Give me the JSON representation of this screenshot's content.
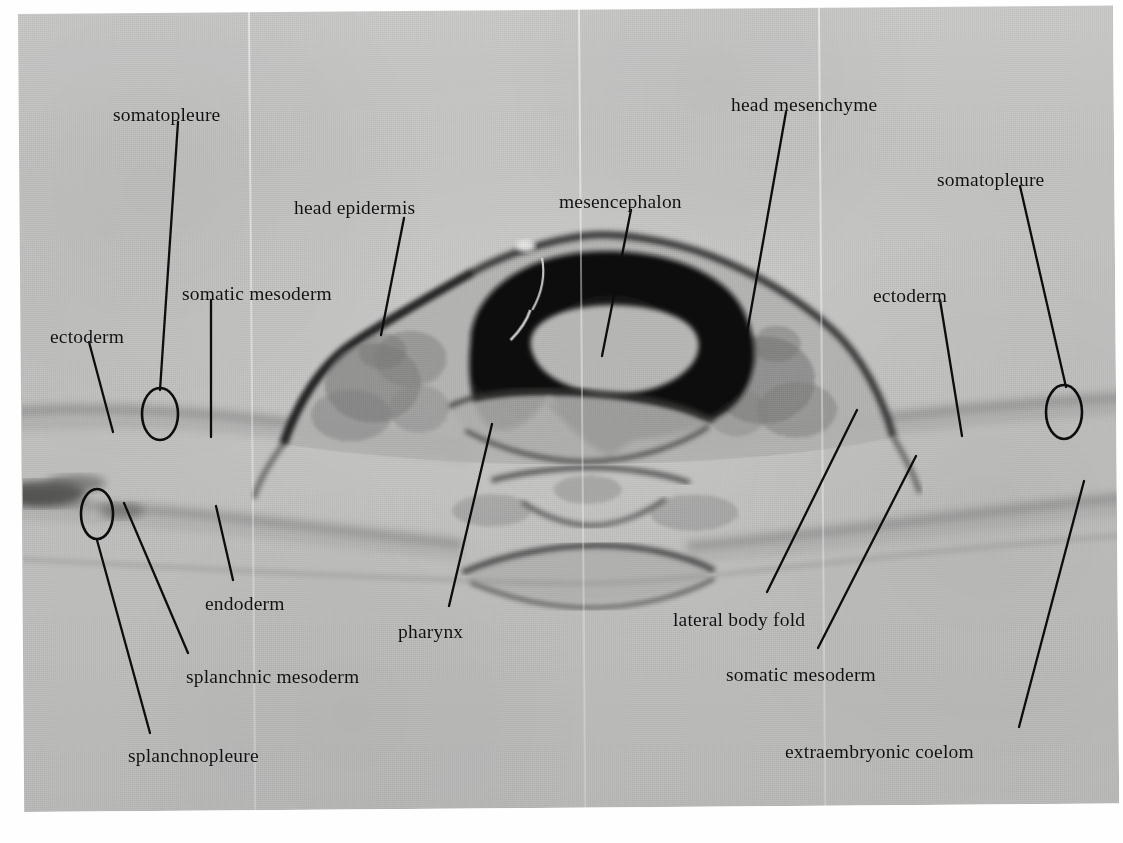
{
  "figure": {
    "kind": "light-micrograph",
    "plate_background_hex": "#c7c7c6",
    "ink_hex": "#0d0d0d",
    "page_background_hex": "#ffffff"
  },
  "labels": [
    {
      "id": "somatopleure-left",
      "text": "somatopleure",
      "x": 113,
      "y": 105
    },
    {
      "id": "head-mesenchyme",
      "text": "head mesenchyme",
      "x": 731,
      "y": 95
    },
    {
      "id": "somatopleure-right",
      "text": "somatopleure",
      "x": 937,
      "y": 170
    },
    {
      "id": "head-epidermis",
      "text": "head epidermis",
      "x": 294,
      "y": 198
    },
    {
      "id": "mesencephalon",
      "text": "mesencephalon",
      "x": 559,
      "y": 192
    },
    {
      "id": "somatic-mesoderm-left",
      "text": "somatic mesoderm",
      "x": 182,
      "y": 284
    },
    {
      "id": "ectoderm-right",
      "text": "ectoderm",
      "x": 873,
      "y": 286
    },
    {
      "id": "ectoderm-left",
      "text": "ectoderm",
      "x": 50,
      "y": 327
    },
    {
      "id": "endoderm",
      "text": "endoderm",
      "x": 205,
      "y": 594
    },
    {
      "id": "pharynx",
      "text": "pharynx",
      "x": 398,
      "y": 622
    },
    {
      "id": "lateral-body-fold",
      "text": "lateral body fold",
      "x": 673,
      "y": 610
    },
    {
      "id": "splanchnic-mesoderm",
      "text": "splanchnic mesoderm",
      "x": 186,
      "y": 667
    },
    {
      "id": "somatic-mesoderm-right",
      "text": "somatic mesoderm",
      "x": 726,
      "y": 665
    },
    {
      "id": "splanchnopleure",
      "text": "splanchnopleure",
      "x": 128,
      "y": 746
    },
    {
      "id": "extraembryonic-coelom",
      "text": "extraembryonic coelom",
      "x": 785,
      "y": 742
    }
  ],
  "leaders": [
    {
      "id": "leader-somatopleure-left",
      "points": "178,122 160,390"
    },
    {
      "id": "leader-head-epidermis",
      "points": "404,218 381,335"
    },
    {
      "id": "leader-mesencephalon",
      "points": "631,210 602,356"
    },
    {
      "id": "leader-head-mesenchyme",
      "points": "786,112 742,361"
    },
    {
      "id": "leader-somatopleure-right",
      "points": "1020,186 1066,387"
    },
    {
      "id": "leader-somatic-mesoderm-left",
      "points": "211,300 211,437"
    },
    {
      "id": "leader-ectoderm-left",
      "points": "89,342 113,432"
    },
    {
      "id": "leader-ectoderm-right",
      "points": "940,300 962,436"
    },
    {
      "id": "leader-endoderm",
      "points": "233,580 216,506"
    },
    {
      "id": "leader-pharynx",
      "points": "449,606 492,424"
    },
    {
      "id": "leader-lateral-body-fold",
      "points": "767,592 857,410"
    },
    {
      "id": "leader-splanchnic-mesoderm",
      "points": "188,653 124,503"
    },
    {
      "id": "leader-somatic-mesoderm-right",
      "points": "818,648 916,456"
    },
    {
      "id": "leader-splanchnopleure",
      "points": "150,733 97,540"
    },
    {
      "id": "leader-extraembryonic-coelom",
      "points": "1019,727 1084,481"
    }
  ],
  "markers": [
    {
      "id": "marker-somatopleure-left",
      "shape": "ellipse",
      "cx": 160,
      "cy": 414,
      "rx": 18,
      "ry": 26
    },
    {
      "id": "marker-somatopleure-right",
      "shape": "ellipse",
      "cx": 1064,
      "cy": 412,
      "rx": 18,
      "ry": 27
    },
    {
      "id": "marker-splanchnopleure",
      "shape": "ellipse",
      "cx": 97,
      "cy": 514,
      "rx": 16,
      "ry": 25
    }
  ]
}
